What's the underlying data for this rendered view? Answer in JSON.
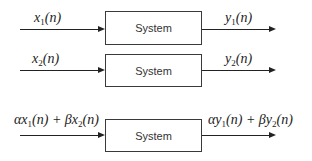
{
  "diagram": {
    "type": "block-diagram",
    "rows": [
      {
        "input": {
          "pre": "",
          "var": "x",
          "sub": "1",
          "arg": "(n)"
        },
        "block_label": "System",
        "output": {
          "pre": "",
          "var": "y",
          "sub": "1",
          "arg": "(n)"
        }
      },
      {
        "input": {
          "pre": "",
          "var": "x",
          "sub": "2",
          "arg": "(n)"
        },
        "block_label": "System",
        "output": {
          "pre": "",
          "var": "y",
          "sub": "2",
          "arg": "(n)"
        }
      },
      {
        "input_text": "αx1(n) + βx2(n)",
        "input": {
          "a": "α",
          "v1": "x",
          "s1": "1",
          "arg1": "(n) + ",
          "b": "β",
          "v2": "x",
          "s2": "2",
          "arg2": "(n)"
        },
        "block_label": "System",
        "output_text": "αy1(n) + βy2(n)",
        "output": {
          "a": "α",
          "v1": "y",
          "s1": "1",
          "arg1": "(n) + ",
          "b": "β",
          "v2": "y",
          "s2": "2",
          "arg2": "(n)"
        }
      }
    ]
  }
}
